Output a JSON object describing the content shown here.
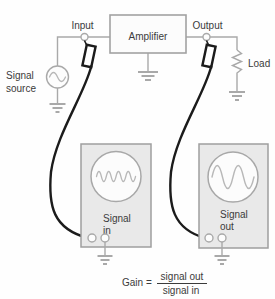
{
  "amplifier": {
    "label": "Amplifier"
  },
  "terminals": {
    "input_label": "Input",
    "output_label": "Output"
  },
  "signal_source": {
    "line1": "Signal",
    "line2": "source"
  },
  "load": {
    "label": "Load"
  },
  "oscilloscope_in": {
    "line1": "Signal",
    "line2": "in"
  },
  "oscilloscope_out": {
    "line1": "Signal",
    "line2": "out"
  },
  "gain_formula": {
    "prefix": "Gain =",
    "numerator": "signal out",
    "denominator": "signal in"
  },
  "icons": {
    "signal_source": "sine-source-icon",
    "load": "resistor-icon",
    "grounds": "ground-icon",
    "probes": "test-probe-icon",
    "scope_in_screen": "sine-wave-small-icon",
    "scope_out_screen": "sine-wave-large-icon"
  },
  "colors": {
    "background": "#fefefe",
    "wire_gray": "#a9a9a9",
    "box_border": "#9e9e9e",
    "scope_fill": "#e9e9e9",
    "screen_wave": "#b8b8b8",
    "cable_black": "#1b1b1b",
    "text": "#3b3b3b"
  }
}
